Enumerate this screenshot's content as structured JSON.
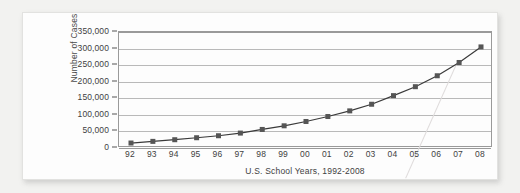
{
  "chart_data": {
    "type": "line",
    "title": "",
    "subtitle": "",
    "xlabel": "U.S. School Years, 1992-2008",
    "ylabel": "Number of Cases",
    "categories": [
      "92",
      "93",
      "94",
      "95",
      "96",
      "97",
      "98",
      "99",
      "00",
      "01",
      "02",
      "03",
      "04",
      "05",
      "06",
      "07",
      "08"
    ],
    "values": [
      15000,
      20000,
      25000,
      31000,
      37000,
      45000,
      56000,
      67000,
      80000,
      95000,
      112000,
      132000,
      158000,
      185000,
      218000,
      258000,
      305000
    ],
    "series": [
      {
        "name": "Number of Cases",
        "values": [
          15000,
          20000,
          25000,
          31000,
          37000,
          45000,
          56000,
          67000,
          80000,
          95000,
          112000,
          132000,
          158000,
          185000,
          218000,
          258000,
          305000
        ]
      }
    ],
    "ylim": [
      0,
      350000
    ],
    "yticks": [
      0,
      50000,
      100000,
      150000,
      200000,
      250000,
      300000,
      350000
    ],
    "ytick_labels": [
      "0",
      "50,000",
      "100,000",
      "150,000",
      "200,000",
      "250,000",
      "300,000",
      "350,000"
    ],
    "xtick_labels": [
      "92",
      "93",
      "94",
      "95",
      "96",
      "97",
      "98",
      "99",
      "00",
      "01",
      "02",
      "03",
      "04",
      "05",
      "06",
      "07",
      "08"
    ],
    "grid": "horizontal",
    "legend": "none",
    "marker": "square",
    "line_color": "#3a3a3a",
    "marker_color": "#555555",
    "grid_color": "#b9b9b9",
    "axis_color": "#9a9a9a",
    "annotations": []
  },
  "card": {
    "background_color": "#fdfdfd",
    "page_background_color": "#f2f2f0"
  }
}
